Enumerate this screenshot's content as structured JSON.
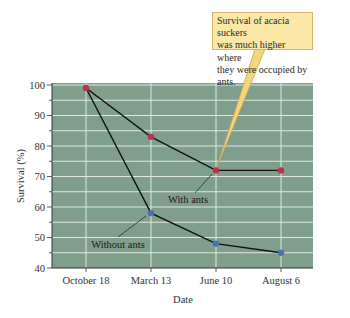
{
  "chart_data": {
    "type": "line",
    "title": "",
    "xlabel": "Date",
    "ylabel": "Survival (%)",
    "categories": [
      "October 18",
      "March 13",
      "June 10",
      "August 6"
    ],
    "series": [
      {
        "name": "With ants",
        "values": [
          99,
          83,
          72,
          72
        ],
        "marker_color": "#c0304a"
      },
      {
        "name": "Without ants",
        "values": [
          99,
          58,
          48,
          45
        ],
        "marker_color": "#4a6fb5"
      }
    ],
    "ylim": [
      40,
      100
    ],
    "yticks": [
      40,
      50,
      60,
      70,
      80,
      90,
      100
    ],
    "y_minor_step": 5,
    "grid": true,
    "legend": "inline labels",
    "annotation": "Survival of acacia suckers was much higher where they were occupied by ants.",
    "colors": {
      "plot_background": "#7f9e8b",
      "grid": "#dde8e0",
      "line": "#111111",
      "callout_fill": "#fbe7a6",
      "callout_border": "#d6b56a"
    }
  },
  "labels": {
    "with_ants": "With ants",
    "without_ants": "Without ants",
    "callout_line1": "Survival of acacia suckers",
    "callout_line2": "was much higher where",
    "callout_line3": "they were occupied by ants."
  }
}
